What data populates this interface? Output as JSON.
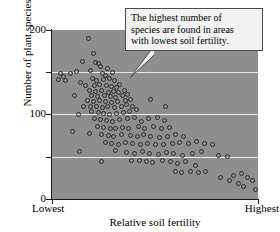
{
  "chart_data": {
    "type": "scatter",
    "title": "",
    "xlabel": "Relative soil fertility",
    "ylabel": "Number of plant species",
    "x_tick_labels": [
      "Lowest",
      "Highest"
    ],
    "y_ticks": [
      0,
      50,
      100,
      150,
      200
    ],
    "y_tick_labels": [
      "0",
      "100",
      "200"
    ],
    "ylim": [
      0,
      200
    ],
    "xlim": [
      0,
      100
    ],
    "grid": "horizontal white gridlines at 50, 100, 150",
    "legend": "none",
    "plot_background": "#8e8e8e",
    "marker": "open circle",
    "marker_color": "#2b2b2b",
    "annotation": {
      "text": "The highest number of species are found in areas with lowest soil fertility.",
      "lines": [
        "The highest number of",
        "species are found in areas",
        "with lowest soil fertility."
      ],
      "points_to": "upper-left high-species region"
    },
    "points": [
      [
        17.5,
        190
      ],
      [
        20.0,
        172
      ],
      [
        15.0,
        163
      ],
      [
        21.0,
        162
      ],
      [
        22.5,
        160
      ],
      [
        18.5,
        152
      ],
      [
        23.5,
        157
      ],
      [
        27.0,
        155
      ],
      [
        12.0,
        151
      ],
      [
        9.0,
        149
      ],
      [
        4.0,
        148
      ],
      [
        5.5,
        145
      ],
      [
        24.5,
        148
      ],
      [
        26.0,
        146
      ],
      [
        29.5,
        150
      ],
      [
        3.0,
        142
      ],
      [
        6.5,
        140
      ],
      [
        19.5,
        143
      ],
      [
        21.5,
        140
      ],
      [
        25.0,
        141
      ],
      [
        28.0,
        143
      ],
      [
        30.5,
        140
      ],
      [
        14.0,
        138
      ],
      [
        16.5,
        134
      ],
      [
        20.5,
        134
      ],
      [
        23.0,
        136
      ],
      [
        26.5,
        134
      ],
      [
        29.0,
        133
      ],
      [
        31.5,
        132
      ],
      [
        33.0,
        136
      ],
      [
        11.0,
        122
      ],
      [
        18.0,
        128
      ],
      [
        21.0,
        127
      ],
      [
        24.0,
        128
      ],
      [
        27.5,
        126
      ],
      [
        30.0,
        127
      ],
      [
        32.5,
        126
      ],
      [
        35.0,
        128
      ],
      [
        19.0,
        122
      ],
      [
        22.0,
        121
      ],
      [
        25.5,
        122
      ],
      [
        28.5,
        121
      ],
      [
        31.0,
        120
      ],
      [
        34.0,
        122
      ],
      [
        36.5,
        124
      ],
      [
        17.0,
        116
      ],
      [
        20.0,
        115
      ],
      [
        23.0,
        116
      ],
      [
        26.0,
        115
      ],
      [
        29.0,
        114
      ],
      [
        32.0,
        115
      ],
      [
        35.5,
        116
      ],
      [
        38.0,
        118
      ],
      [
        15.5,
        110
      ],
      [
        18.5,
        109
      ],
      [
        21.5,
        110
      ],
      [
        24.5,
        108
      ],
      [
        27.0,
        109
      ],
      [
        30.5,
        108
      ],
      [
        33.5,
        110
      ],
      [
        36.0,
        112
      ],
      [
        39.0,
        110
      ],
      [
        13.0,
        100
      ],
      [
        19.0,
        103
      ],
      [
        22.5,
        102
      ],
      [
        25.0,
        101
      ],
      [
        28.0,
        100
      ],
      [
        31.5,
        101
      ],
      [
        34.5,
        102
      ],
      [
        37.5,
        104
      ],
      [
        41.0,
        106
      ],
      [
        48.0,
        118
      ],
      [
        55.0,
        110
      ],
      [
        20.5,
        95
      ],
      [
        23.5,
        94
      ],
      [
        26.5,
        93
      ],
      [
        29.5,
        92
      ],
      [
        33.0,
        94
      ],
      [
        36.5,
        95
      ],
      [
        40.0,
        96
      ],
      [
        43.5,
        92
      ],
      [
        47.0,
        95
      ],
      [
        51.0,
        96
      ],
      [
        54.5,
        93
      ],
      [
        22.0,
        86
      ],
      [
        25.0,
        85
      ],
      [
        28.5,
        84
      ],
      [
        31.0,
        83
      ],
      [
        34.0,
        85
      ],
      [
        37.0,
        84
      ],
      [
        42.0,
        86
      ],
      [
        45.0,
        84
      ],
      [
        49.5,
        86
      ],
      [
        53.0,
        84
      ],
      [
        57.0,
        85
      ],
      [
        18.0,
        78
      ],
      [
        24.0,
        76
      ],
      [
        27.5,
        75
      ],
      [
        30.0,
        74
      ],
      [
        33.5,
        76
      ],
      [
        38.0,
        75
      ],
      [
        41.5,
        74
      ],
      [
        44.5,
        76
      ],
      [
        48.0,
        74
      ],
      [
        52.0,
        73
      ],
      [
        56.0,
        74
      ],
      [
        60.0,
        76
      ],
      [
        64.0,
        74
      ],
      [
        26.0,
        67
      ],
      [
        29.0,
        66
      ],
      [
        32.5,
        65
      ],
      [
        35.5,
        67
      ],
      [
        39.0,
        66
      ],
      [
        43.0,
        64
      ],
      [
        46.5,
        66
      ],
      [
        50.0,
        65
      ],
      [
        54.0,
        64
      ],
      [
        58.5,
        66
      ],
      [
        62.0,
        67
      ],
      [
        66.5,
        66
      ],
      [
        70.0,
        68
      ],
      [
        74.0,
        66
      ],
      [
        78.0,
        64
      ],
      [
        10.0,
        80
      ],
      [
        13.5,
        56
      ],
      [
        31.0,
        57
      ],
      [
        36.0,
        55
      ],
      [
        40.0,
        54
      ],
      [
        44.0,
        56
      ],
      [
        47.5,
        54
      ],
      [
        51.5,
        53
      ],
      [
        55.5,
        55
      ],
      [
        59.0,
        54
      ],
      [
        63.5,
        52
      ],
      [
        68.0,
        54
      ],
      [
        72.5,
        56
      ],
      [
        81.0,
        52
      ],
      [
        85.0,
        50
      ],
      [
        38.5,
        46
      ],
      [
        42.5,
        45
      ],
      [
        46.0,
        44
      ],
      [
        49.0,
        43
      ],
      [
        53.5,
        45
      ],
      [
        57.5,
        44
      ],
      [
        61.0,
        42
      ],
      [
        65.0,
        44
      ],
      [
        69.5,
        40
      ],
      [
        24.0,
        44
      ],
      [
        60.0,
        33
      ],
      [
        63.0,
        31
      ],
      [
        67.0,
        32
      ],
      [
        71.0,
        31
      ],
      [
        74.5,
        33
      ],
      [
        88.0,
        28
      ],
      [
        92.0,
        30
      ],
      [
        95.0,
        25
      ],
      [
        90.5,
        18
      ],
      [
        93.0,
        15
      ],
      [
        97.5,
        22
      ],
      [
        99.0,
        11
      ],
      [
        82.0,
        25
      ],
      [
        86.0,
        22
      ]
    ]
  }
}
